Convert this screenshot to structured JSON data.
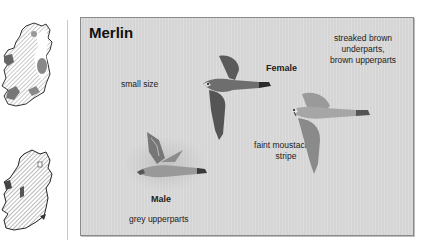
{
  "maps": [
    {
      "name": "winter-distribution-map",
      "region": "Ireland"
    },
    {
      "name": "breeding-distribution-map",
      "region": "Ireland"
    }
  ],
  "plate": {
    "title": "Merlin",
    "labels": {
      "small_size": "small size",
      "female": "Female",
      "streaked_1": "streaked brown",
      "streaked_2": "underparts,",
      "streaked_3": "brown upperparts",
      "moustachial_1": "faint moustachial",
      "moustachial_2": "stripe",
      "male": "Male",
      "grey_upperparts": "grey upperparts"
    },
    "colors": {
      "background": "#d9d9d9",
      "border": "#8a8a8a",
      "text": "#222222"
    }
  }
}
